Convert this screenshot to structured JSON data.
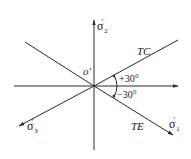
{
  "diagram": {
    "origin_label": "o'",
    "axes": {
      "sigma2": {
        "symbol": "σ",
        "prime": "′",
        "subscript": "2"
      },
      "sigma1": {
        "symbol": "σ",
        "prime": "′",
        "subscript": "1"
      },
      "sigma3": {
        "symbol": "σ",
        "prime": "′",
        "subscript": "3"
      }
    },
    "lines": {
      "tc_label": "TC",
      "te_label": "TE"
    },
    "angles": {
      "upper": "+30°",
      "lower": "−30°"
    },
    "colors": {
      "line": "#2a2a2a",
      "background": "#ffffff"
    }
  }
}
